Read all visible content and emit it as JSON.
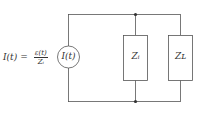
{
  "equation": {
    "lhs": "I(t)",
    "equals": "=",
    "numerator": "ε(t)",
    "denominator": "Zᵢ"
  },
  "components": {
    "source": {
      "label": "I(t)",
      "type": "current-source"
    },
    "internal_impedance": {
      "label": "Zᵢ",
      "type": "impedance"
    },
    "load_impedance": {
      "label": "Z_L",
      "display": "Zʟ",
      "type": "impedance"
    }
  },
  "colors": {
    "wire": "#555555",
    "text": "#333333",
    "background": "#ffffff"
  }
}
